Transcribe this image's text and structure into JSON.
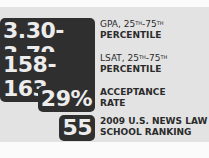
{
  "stats": [
    {
      "value": "3.30-3.79",
      "label_line1": "GPA, 25",
      "sup1": "TH",
      "dash": "-75",
      "sup2": "TH",
      "label_line2": "PERCENTILE"
    },
    {
      "value": "158-163",
      "label_line1": "LSAT, 25",
      "sup1": "TH",
      "dash": "-75",
      "sup2": "TH",
      "label_line2": "PERCENTILE"
    },
    {
      "value": "29%",
      "label_line1": "ACCEPTANCE",
      "label_line2": "RATE"
    },
    {
      "value": "55",
      "label_line1": "2009 U.S. NEWS LAW",
      "label_line2": "SCHOOL RANKING"
    }
  ],
  "colors": {
    "panel": "#e3e3e3",
    "badge": "#2f2f2f",
    "badge_text": "#ececec",
    "label_text": "#2b2b2b"
  }
}
